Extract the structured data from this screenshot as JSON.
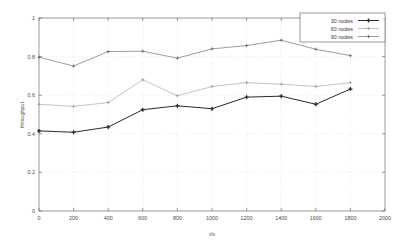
{
  "chart_data": {
    "type": "line",
    "title": "",
    "xlabel": "t/s",
    "ylabel": "throughput",
    "xlim": [
      0,
      2000
    ],
    "ylim": [
      0,
      1
    ],
    "xticks": [
      0,
      200,
      400,
      600,
      800,
      1000,
      1200,
      1400,
      1600,
      1800,
      2000
    ],
    "xtick_labels": [
      "0",
      "200",
      "400",
      "600",
      "800",
      "1000",
      "1200",
      "1400",
      "1600",
      "1800",
      "2000"
    ],
    "yticks": [
      0,
      0.2,
      0.4,
      0.6,
      0.8,
      1
    ],
    "ytick_labels": [
      "0",
      "0.2",
      "0.4",
      "0.6",
      "0.8",
      "1"
    ],
    "grid": true,
    "legend_position": "top-right",
    "x": [
      0,
      200,
      400,
      600,
      800,
      1000,
      1200,
      1400,
      1600,
      1800
    ],
    "series": [
      {
        "name": "30 nodes",
        "color": "#2b2b2b",
        "marker": "plus-bold",
        "values": [
          0.415,
          0.408,
          0.435,
          0.525,
          0.545,
          0.53,
          0.59,
          0.595,
          0.553,
          0.632
        ]
      },
      {
        "name": "60 nodes",
        "color": "#9a9a9a",
        "marker": "plus-light",
        "values": [
          0.553,
          0.542,
          0.562,
          0.68,
          0.597,
          0.645,
          0.665,
          0.657,
          0.645,
          0.665
        ]
      },
      {
        "name": "90 nodes",
        "color": "#5d5d5d",
        "marker": "plus",
        "values": [
          0.797,
          0.751,
          0.826,
          0.828,
          0.792,
          0.84,
          0.857,
          0.885,
          0.838,
          0.805
        ]
      }
    ]
  },
  "legend": {
    "entries": [
      {
        "label": "30 nodes"
      },
      {
        "label": "60 nodes"
      },
      {
        "label": "90 nodes"
      }
    ]
  }
}
